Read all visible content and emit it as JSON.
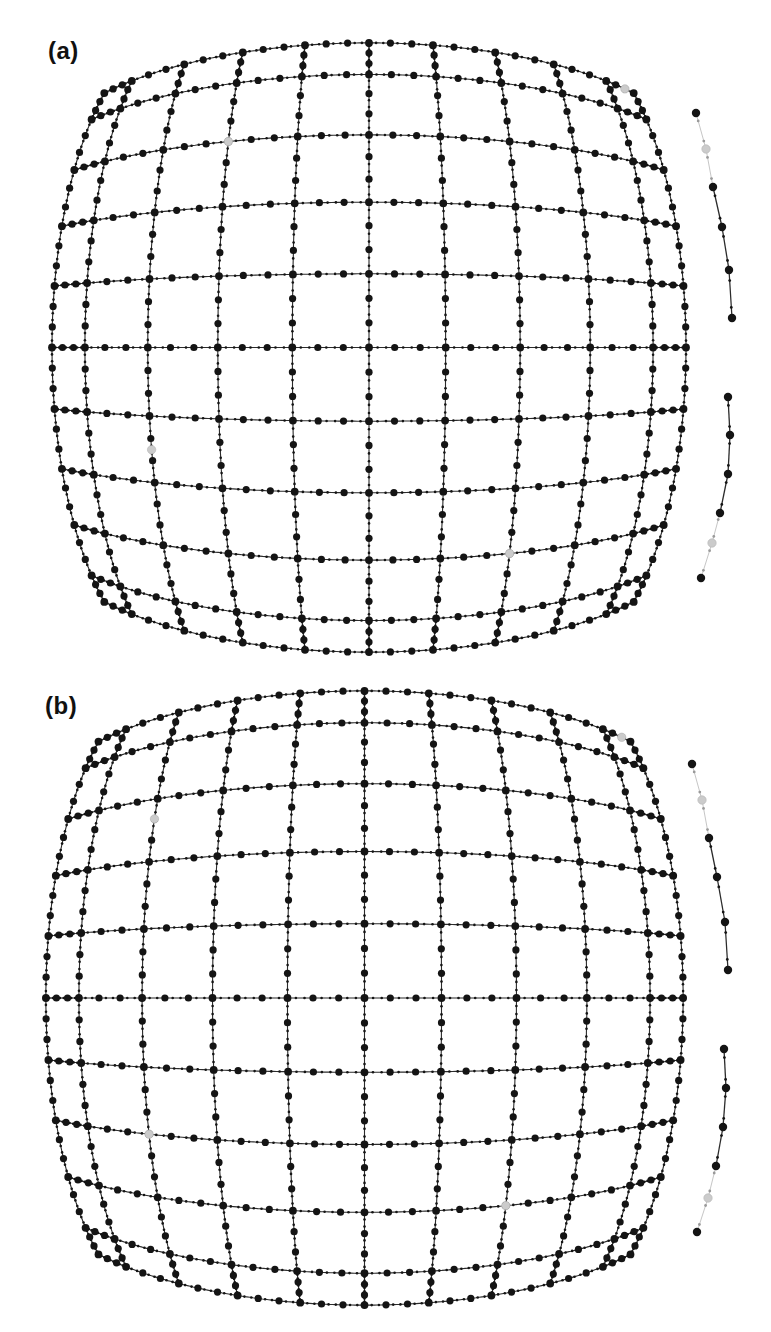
{
  "figure": {
    "panels": [
      {
        "label": "(a)",
        "grid": {
          "cx": 369,
          "cy": 347.5,
          "sx": 77,
          "sy": 74,
          "rows": 11,
          "cols": 11,
          "positions": [
            -4.6,
            -4,
            -3,
            -2,
            -1,
            0,
            1,
            2,
            3,
            4,
            4.6
          ],
          "dot_fractions": [
            0.3333,
            0.6667
          ],
          "tick_fractions": [
            0.1111,
            0.2222,
            0.4444,
            0.5556,
            0.7778,
            0.8889
          ]
        },
        "gray_markers": [
          {
            "u": -2,
            "v": -3
          },
          {
            "u": 4.4,
            "v": -4.6
          },
          {
            "u": -3,
            "v": 1.5
          },
          {
            "u": 2,
            "v": 3
          }
        ],
        "insets": [
          {
            "points": [
              [
                696,
                113
              ],
              [
                706,
                149
              ],
              [
                713,
                187
              ],
              [
                722,
                227
              ],
              [
                729,
                270
              ],
              [
                732,
                318
              ]
            ],
            "gray_index": 1,
            "light_segments": [
              0,
              1
            ]
          },
          {
            "points": [
              [
                728,
                397
              ],
              [
                730,
                435
              ],
              [
                728,
                474
              ],
              [
                720,
                513
              ],
              [
                712,
                543
              ],
              [
                701,
                578
              ]
            ],
            "gray_index": 4,
            "light_segments": [
              3,
              4
            ]
          }
        ]
      },
      {
        "label": "(b)",
        "grid": {
          "cx": 364.5,
          "cy": 998,
          "sx": 77.4,
          "sy": 74.6,
          "rows": 11,
          "cols": 11,
          "positions": [
            -4.6,
            -4,
            -3,
            -2,
            -1,
            0,
            1,
            2,
            3,
            4,
            4.6
          ],
          "dot_fractions": [
            0.3333,
            0.6667
          ],
          "tick_fractions": [
            0.1111,
            0.2222,
            0.4444,
            0.5556,
            0.7778,
            0.8889
          ]
        },
        "gray_markers": [
          {
            "u": -3,
            "v": -2.67
          },
          {
            "u": 4.4,
            "v": -4.6
          },
          {
            "u": -3,
            "v": 2
          },
          {
            "u": 2,
            "v": 3
          }
        ],
        "insets": [
          {
            "points": [
              [
                692,
                764
              ],
              [
                702,
                800
              ],
              [
                709,
                838
              ],
              [
                717,
                877
              ],
              [
                725,
                922
              ],
              [
                728,
                970
              ]
            ],
            "gray_index": 1,
            "light_segments": [
              0,
              1
            ]
          },
          {
            "points": [
              [
                724,
                1049
              ],
              [
                726,
                1088
              ],
              [
                723,
                1127
              ],
              [
                716,
                1166
              ],
              [
                708,
                1198
              ],
              [
                697,
                1232
              ]
            ],
            "gray_index": 4,
            "light_segments": [
              3,
              4
            ]
          }
        ]
      }
    ],
    "distortion": {
      "model": "barrel",
      "a": 0.0045,
      "b": 2.2e-05,
      "c": 0.0078
    },
    "style": {
      "background": "#ffffff",
      "dot_color": "#141414",
      "line_color": "#2b2b2b",
      "line_width": 1.1,
      "gray_color": "#cbcbcb",
      "gray_stroke": "#b4b4b4",
      "light_line_color": "#c6c6c6",
      "node_radius": 3.9,
      "dot_radius": 3.6,
      "tick_radius": 1.3,
      "gray_radius": 4.2
    }
  }
}
